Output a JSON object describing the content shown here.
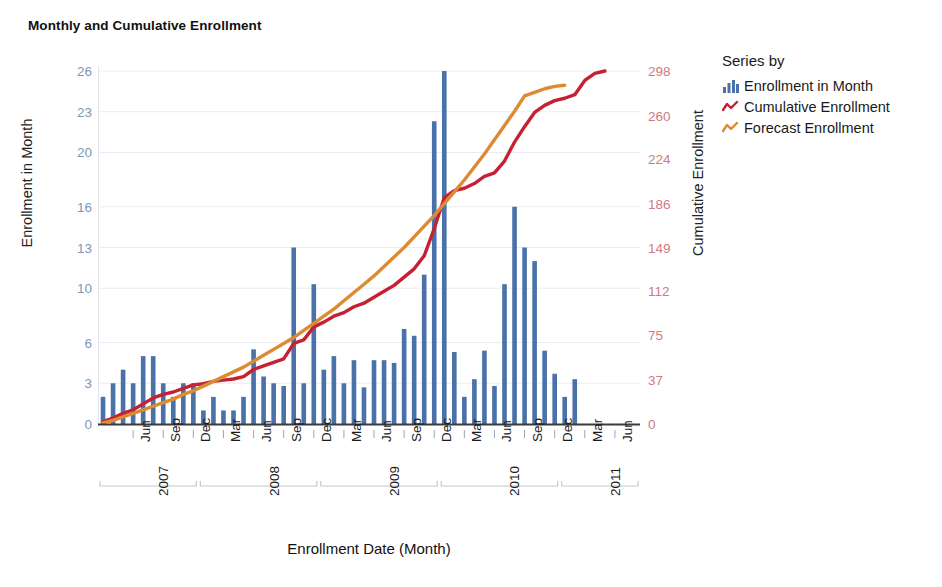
{
  "title": "Monthly and Cumulative Enrollment",
  "axes": {
    "left_title": "Enrollment in Month",
    "right_title": "Cumulative Enrollment",
    "x_title": "Enrollment Date (Month)",
    "left_ticks": [
      0,
      3,
      6,
      10,
      13,
      16,
      20,
      23,
      26
    ],
    "right_ticks": [
      0,
      37,
      75,
      112,
      149,
      186,
      224,
      260,
      298
    ],
    "left_color": "#7e97b5",
    "right_color": "#cf7b82"
  },
  "legend": {
    "title": "Series by",
    "items": [
      {
        "label": "Enrollment in Month",
        "icon": "bar-chart-icon",
        "color": "#4a72a8"
      },
      {
        "label": "Cumulative Enrollment",
        "icon": "line-zigzag-icon",
        "color": "#c62033"
      },
      {
        "label": "Forecast Enrollment",
        "icon": "line-zigzag-icon",
        "color": "#dd8b33"
      }
    ]
  },
  "chart_data": {
    "type": "bar",
    "title": "Monthly and Cumulative Enrollment",
    "xlabel": "Enrollment Date (Month)",
    "ylabel": "Enrollment in Month",
    "y2label": "Cumulative Enrollment",
    "ylim": [
      0,
      26
    ],
    "y2lim": [
      0,
      298
    ],
    "grid": true,
    "legend_position": "right",
    "categories": [
      "2007-03",
      "2007-04",
      "2007-05",
      "2007-06",
      "2007-07",
      "2007-08",
      "2007-09",
      "2007-10",
      "2007-11",
      "2007-12",
      "2008-01",
      "2008-02",
      "2008-03",
      "2008-04",
      "2008-05",
      "2008-06",
      "2008-07",
      "2008-08",
      "2008-09",
      "2008-10",
      "2008-11",
      "2008-12",
      "2009-01",
      "2009-02",
      "2009-03",
      "2009-04",
      "2009-05",
      "2009-06",
      "2009-07",
      "2009-08",
      "2009-09",
      "2009-10",
      "2009-11",
      "2009-12",
      "2010-01",
      "2010-02",
      "2010-03",
      "2010-04",
      "2010-05",
      "2010-06",
      "2010-07",
      "2010-08",
      "2010-09",
      "2010-10",
      "2010-11",
      "2010-12",
      "2011-01",
      "2011-02",
      "2011-03",
      "2011-04",
      "2011-05",
      "2011-06",
      "2011-07",
      "2011-08"
    ],
    "tick_labels": {
      "2007-06": "Jun",
      "2007-09": "Sep",
      "2007-12": "Dec",
      "2008-03": "Mar",
      "2008-06": "Jun",
      "2008-09": "Sep",
      "2008-12": "Dec",
      "2009-03": "Mar",
      "2009-06": "Jun",
      "2009-09": "Sep",
      "2009-12": "Dec",
      "2010-03": "Mar",
      "2010-06": "Jun",
      "2010-09": "Sep",
      "2010-12": "Dec",
      "2011-03": "Mar",
      "2011-06": "Jun"
    },
    "year_groups": [
      {
        "year": "2007",
        "start": 0,
        "end": 9
      },
      {
        "year": "2008",
        "start": 10,
        "end": 21
      },
      {
        "year": "2009",
        "start": 22,
        "end": 33
      },
      {
        "year": "2010",
        "start": 34,
        "end": 45
      },
      {
        "year": "2011",
        "start": 46,
        "end": 53
      }
    ],
    "series": [
      {
        "name": "Enrollment in Month",
        "axis": "left",
        "type": "bar",
        "color": "#4a72a8",
        "values": [
          2,
          3,
          4,
          3,
          5,
          5,
          3,
          2,
          3,
          3,
          1,
          2,
          1,
          1,
          2,
          5.5,
          3.5,
          3,
          2.8,
          13,
          3,
          10.3,
          4,
          5,
          3,
          4.7,
          2.7,
          4.7,
          4.7,
          4.5,
          7,
          6.5,
          11,
          22.3,
          26,
          5.3,
          2,
          3.3,
          5.4,
          2.8,
          10.3,
          16,
          13,
          12,
          5.4,
          3.7,
          2,
          3.3,
          0,
          0,
          0,
          0,
          0,
          0
        ]
      },
      {
        "name": "Cumulative Enrollment",
        "axis": "right",
        "type": "line",
        "color": "#c62033",
        "values": [
          2,
          5,
          9,
          12,
          17,
          22,
          25,
          27,
          30,
          33,
          34,
          36,
          37,
          38,
          40,
          46,
          49,
          52,
          55,
          68,
          71,
          82,
          86,
          91,
          94,
          99,
          102,
          107,
          112,
          117,
          124,
          131,
          142,
          165,
          191,
          197,
          199,
          203,
          209,
          212,
          222,
          238,
          251,
          263,
          269,
          273,
          275,
          278,
          290,
          296,
          298,
          298,
          298,
          298
        ]
      },
      {
        "name": "Forecast Enrollment",
        "axis": "right",
        "type": "line",
        "color": "#dd8b33",
        "values": [
          1,
          3,
          6,
          9,
          12,
          15,
          18,
          21,
          25,
          28,
          32,
          36,
          40,
          44,
          48,
          53,
          58,
          63,
          68,
          73,
          79,
          85,
          91,
          97,
          104,
          111,
          118,
          125,
          133,
          141,
          149,
          158,
          167,
          176,
          186,
          196,
          206,
          217,
          228,
          240,
          252,
          264,
          277,
          280,
          283,
          285,
          286,
          286,
          286,
          286,
          286,
          286,
          286,
          286
        ]
      }
    ]
  }
}
